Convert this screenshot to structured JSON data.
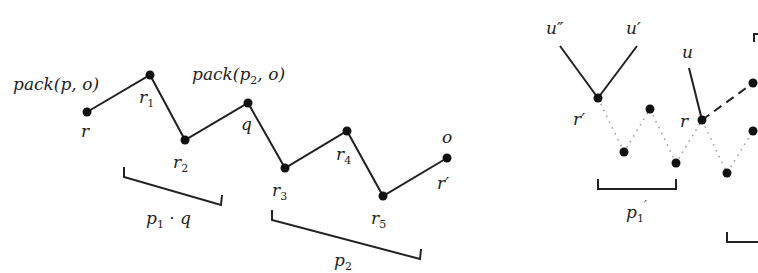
{
  "left": {
    "points": [
      {
        "id": "r",
        "x": 87,
        "y": 112,
        "label": "r",
        "lx": 80,
        "ly": 137
      },
      {
        "id": "r1",
        "x": 150,
        "y": 75,
        "label": "r",
        "sub": "1",
        "lx": 140,
        "ly": 103
      },
      {
        "id": "r2",
        "x": 185,
        "y": 140,
        "label": "r",
        "sub": "2",
        "lx": 174,
        "ly": 168
      },
      {
        "id": "q",
        "x": 248,
        "y": 103,
        "label": "q",
        "lx": 241,
        "ly": 130
      },
      {
        "id": "r3",
        "x": 285,
        "y": 168,
        "label": "r",
        "sub": "3",
        "lx": 272,
        "ly": 196
      },
      {
        "id": "r4",
        "x": 347,
        "y": 131,
        "label": "r",
        "sub": "4",
        "lx": 336,
        "ly": 160
      },
      {
        "id": "r5",
        "x": 383,
        "y": 196,
        "label": "r",
        "sub": "5",
        "lx": 372,
        "ly": 224
      },
      {
        "id": "rp",
        "x": 447,
        "y": 158,
        "label": "r′",
        "lx": 437,
        "ly": 189
      }
    ],
    "labels": [
      {
        "text": "pack(p, o)",
        "x": 13,
        "y": 90
      },
      {
        "text": "pack(p",
        "x": 192,
        "y": 80
      },
      {
        "text": "o",
        "x": 442,
        "y": 143
      }
    ],
    "pack2_sub": "2",
    "pack2_tail": ", o)",
    "bracket1_label": "p",
    "bracket1_sub": "1",
    "bracket1_tail": " · q",
    "bracket2_label": "p",
    "bracket2_sub": "2"
  },
  "right": {
    "labels": {
      "u2": "u″",
      "u1": "u′",
      "u": "u",
      "rp": "r′",
      "r": "r",
      "p1p": "p",
      "p1p_sub": "1",
      "p1p_prime": "′"
    }
  }
}
